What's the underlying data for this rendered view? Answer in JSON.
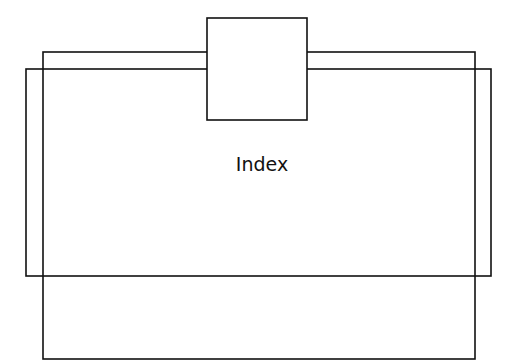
{
  "diagram": {
    "title": "",
    "colors": {
      "stroke": "#111111",
      "background": "#ffffff"
    },
    "shapes": [
      {
        "id": "rect-tall",
        "x": 43,
        "y": 52,
        "width": 432,
        "height": 307
      },
      {
        "id": "rect-wide",
        "x": 26,
        "y": 69,
        "width": 465,
        "height": 207
      },
      {
        "id": "top-box",
        "x": 207,
        "y": 18,
        "width": 100,
        "height": 102
      }
    ],
    "label": {
      "text": "Index",
      "x": 262,
      "y": 171
    }
  }
}
